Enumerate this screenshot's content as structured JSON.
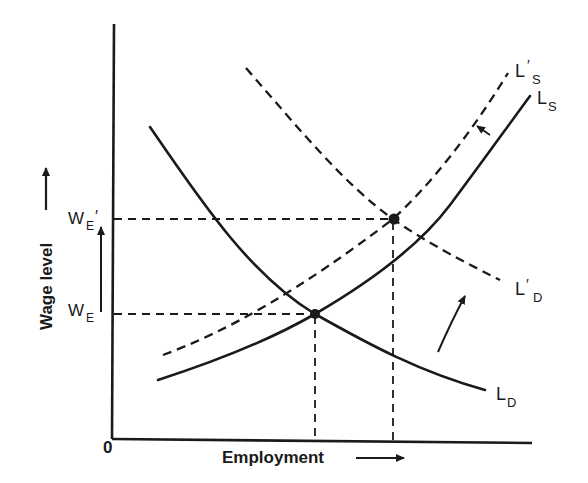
{
  "diagram": {
    "axes": {
      "x_label": "Employment",
      "y_label": "Wage level",
      "origin_label": "0"
    },
    "wage_labels": {
      "w_e": {
        "main": "W",
        "sub": "E"
      },
      "w_e_prime": {
        "main": "W",
        "sub": "E",
        "prime": "′"
      }
    },
    "curves": {
      "ld": {
        "main": "L",
        "sub": "D",
        "style": "solid"
      },
      "ls": {
        "main": "L",
        "sub": "S",
        "style": "solid"
      },
      "ld_prime": {
        "main": "L",
        "prime": "′",
        "sub": "D",
        "style": "dashed"
      },
      "ls_prime": {
        "main": "L",
        "prime": "′",
        "sub": "S",
        "style": "dashed"
      }
    },
    "equilibria": [
      {
        "name": "original equilibrium",
        "curves": [
          "LS",
          "LD"
        ],
        "wage": "WE"
      },
      {
        "name": "new equilibrium",
        "curves": [
          "L'S",
          "L'D"
        ],
        "wage": "WE'"
      }
    ],
    "colors": {
      "ink": "#1a1a1a",
      "background": "#ffffff"
    }
  }
}
